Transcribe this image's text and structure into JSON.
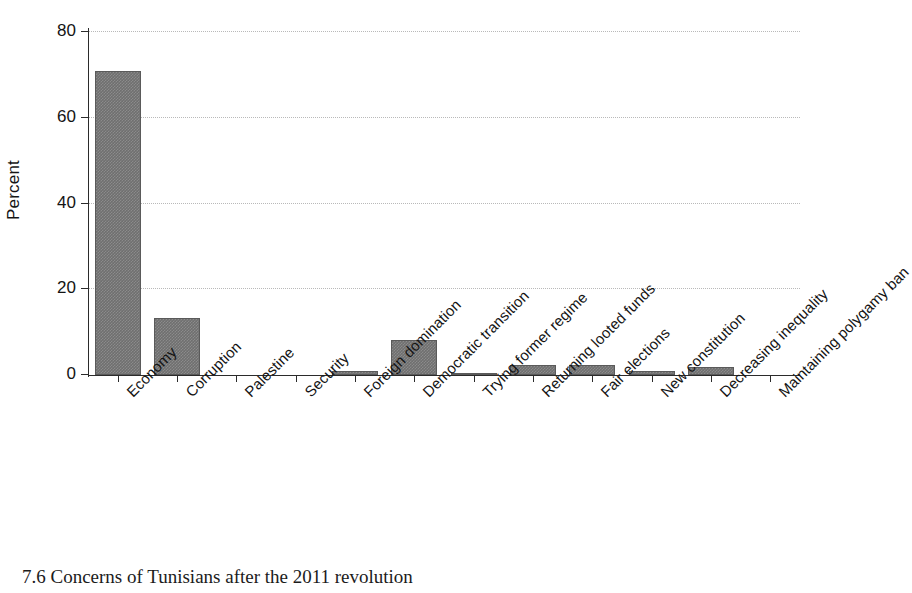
{
  "chart_data": {
    "type": "bar",
    "title": "",
    "xlabel": "",
    "ylabel": "Percent",
    "ylim": [
      0,
      80
    ],
    "yticks": [
      0,
      20,
      40,
      60,
      80
    ],
    "grid": true,
    "legend": null,
    "categories": [
      "Economy",
      "Corruption",
      "Palestine",
      "Security",
      "Foreign domination",
      "Democratic transition",
      "Trying former regime",
      "Returning looted funds",
      "Fair elections",
      "New constitution",
      "Decreasing inequality",
      "Maintaining polygamy ban"
    ],
    "values": [
      70.8,
      13.2,
      0,
      0,
      1.0,
      8.1,
      0.3,
      2.4,
      2.4,
      1.0,
      1.8,
      0
    ]
  },
  "figure": {
    "caption": "7.6 Concerns of Tunisians after the 2011 revolution",
    "bar_color": "#6f6f6f",
    "axis_color": "#2b2b2b",
    "grid_color": "#b9b9b9"
  },
  "scan": {
    "corner_mark": ""
  }
}
